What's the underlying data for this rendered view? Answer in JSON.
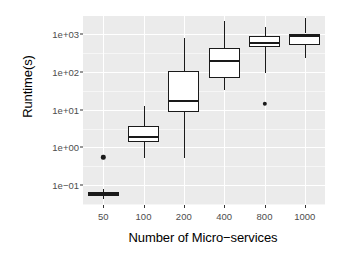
{
  "chart_data": {
    "type": "box",
    "title": "",
    "xlabel": "Number of Micro−services",
    "ylabel": "Runtime(s)",
    "yscale": "log10",
    "ylim": [
      0.03,
      3000
    ],
    "y_tick_labels": [
      "1e+03",
      "1e+02",
      "1e+01",
      "1e+00",
      "1e−01"
    ],
    "y_tick_values": [
      1000,
      100,
      10,
      1,
      0.1
    ],
    "grid": true,
    "legend": null,
    "categories": [
      "50",
      "100",
      "200",
      "400",
      "800",
      "1000"
    ],
    "boxes": [
      {
        "category": "50",
        "whisker_low": 0.042,
        "q1": 0.051,
        "median": 0.058,
        "q3": 0.066,
        "whisker_high": 0.081,
        "outliers": [
          0.55
        ]
      },
      {
        "category": "100",
        "whisker_low": 0.52,
        "q1": 1.37,
        "median": 1.9,
        "q3": 3.8,
        "whisker_high": 12.5,
        "outliers": []
      },
      {
        "category": "200",
        "whisker_low": 0.52,
        "q1": 8.5,
        "median": 16.5,
        "q3": 105,
        "whisker_high": 800,
        "outliers": []
      },
      {
        "category": "400",
        "whisker_low": 33,
        "q1": 68,
        "median": 195,
        "q3": 430,
        "whisker_high": 2200,
        "outliers": []
      },
      {
        "category": "800",
        "whisker_low": 90,
        "q1": 450,
        "median": 580,
        "q3": 900,
        "whisker_high": 1500,
        "outliers": [
          14
        ]
      },
      {
        "category": "1000",
        "whisker_low": 230,
        "q1": 520,
        "median": 880,
        "q3": 1030,
        "whisker_high": 2600,
        "outliers": []
      }
    ],
    "colors": {
      "panel_background": "#ebebeb",
      "grid_major": "#ffffff",
      "box_fill": "#ffffff",
      "box_stroke": "#1a1a1a",
      "tick_label": "#4d4d4d",
      "axis_title": "#000000"
    }
  }
}
